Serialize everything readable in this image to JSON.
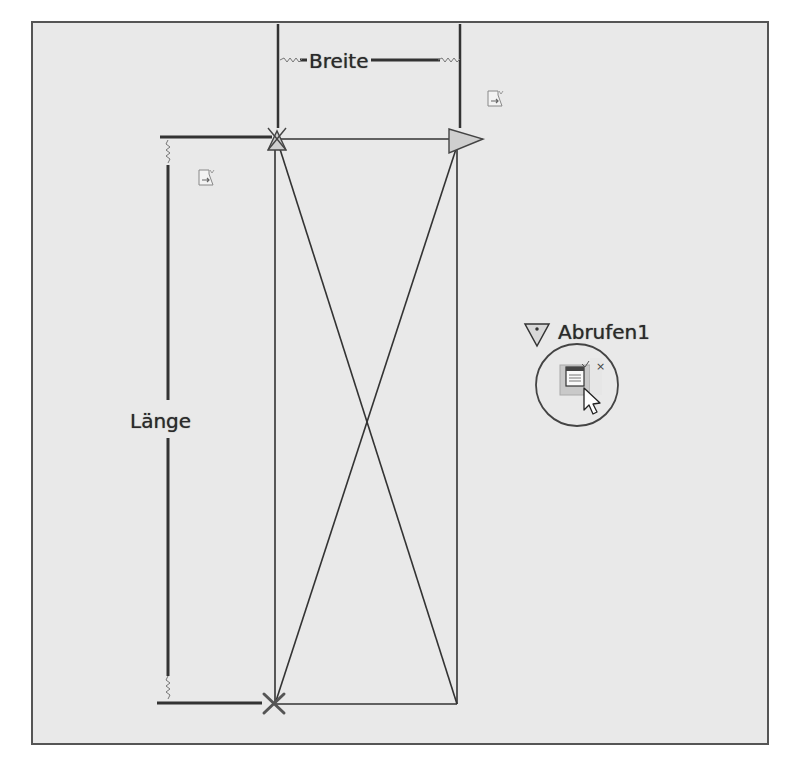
{
  "canvas": {
    "background": "#e9e9e9",
    "frame_color": "#555555"
  },
  "dimensions": {
    "width_label": "Breite",
    "length_label": "Länge"
  },
  "action": {
    "name": "Abrufen1",
    "icon": "lookup-table-icon",
    "close_glyph": "×"
  },
  "icons": {
    "param_set_top_right": "parameter-set-icon",
    "param_set_left": "parameter-set-icon",
    "grip_top_left": "lookup-grip-icon",
    "grip_right": "linear-grip-arrow-icon",
    "grip_bottom_left": "point-grip-x-icon",
    "cursor": "mouse-pointer-icon"
  }
}
